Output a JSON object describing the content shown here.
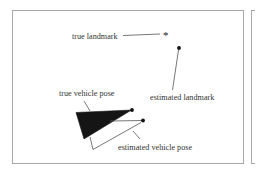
{
  "labels": {
    "true_landmark": "true landmark",
    "estimated_landmark": "estimated landmark",
    "true_vehicle_pose": "true vehicle pose",
    "estimated_vehicle_pose": "estimated vehicle pose"
  },
  "symbols": {
    "true_landmark_marker": "*"
  },
  "colors": {
    "frame": "#a8a8a8",
    "ink": "#222222",
    "leader": "#555555",
    "text": "#333333"
  }
}
